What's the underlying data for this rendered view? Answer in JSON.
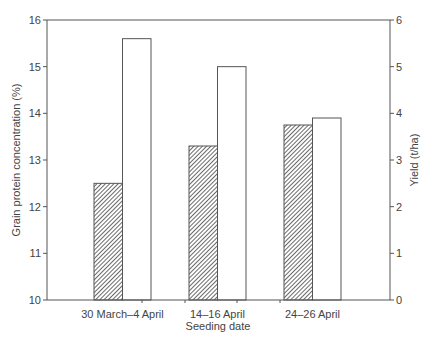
{
  "chart_data": {
    "type": "bar",
    "title": "",
    "xlabel": "Seeding date",
    "ylabel": "Grain protein concentration (%)",
    "ylabel_right": "Yield (t/ha)",
    "categories": [
      "30 March–4 April",
      "14–16 April",
      "24–26 April"
    ],
    "ylim": [
      10,
      16
    ],
    "ylim_right": [
      0,
      6
    ],
    "yticks": [
      10,
      11,
      12,
      13,
      14,
      15,
      16
    ],
    "yticks_right": [
      0,
      1,
      2,
      3,
      4,
      5,
      6
    ],
    "grid": false,
    "legend": null,
    "series": [
      {
        "name": "Grain protein concentration (%)",
        "axis": "left",
        "pattern": "hatched",
        "values": [
          12.5,
          13.3,
          13.75
        ]
      },
      {
        "name": "Yield (t/ha)",
        "axis": "right",
        "pattern": "white",
        "values": [
          5.6,
          5.0,
          3.9
        ]
      }
    ]
  },
  "colors": {
    "axis": "#555555",
    "bar_stroke": "#555555",
    "hatch": "#444444",
    "bar_fill_white": "#ffffff"
  }
}
